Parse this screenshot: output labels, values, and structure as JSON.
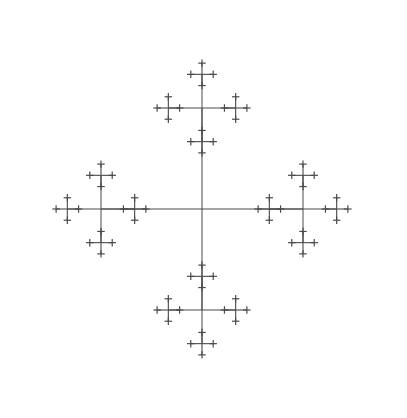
{
  "figure": {
    "background_color": "#ffffff",
    "stroke_color": "#4a4a4a",
    "caption": ""
  },
  "chart_data": {
    "type": "diagram",
    "subtitle": "",
    "xlabel": "",
    "ylabel": "",
    "grid": false,
    "legend": "none",
    "width": 407,
    "height": 418,
    "xlim": [
      0,
      407
    ],
    "ylim": [
      0,
      418
    ],
    "fractal": {
      "rule": "cross-with-children-at-arm-tips",
      "center_x": 202,
      "center_y": 209,
      "root_arm_length": 101,
      "scale_factor": 0.3333,
      "depth": 4,
      "branch_directions": [
        "up",
        "down",
        "left",
        "right"
      ],
      "stroke_color": "#4a4a4a",
      "stroke_widths": [
        1.0,
        1.0,
        1.1,
        1.2
      ],
      "overall_shape": "diamond",
      "extent": {
        "top_tip_y": 8,
        "bottom_tip_y": 410,
        "left_tip_x": 10,
        "right_tip_x": 394
      },
      "level_centers": {
        "level0": [
          [
            202,
            209
          ]
        ],
        "level1": [
          [
            202,
            108
          ],
          [
            202,
            310
          ],
          [
            101,
            209
          ],
          [
            303,
            209
          ]
        ],
        "level2_arm_length": 33.7,
        "level3_arm_length": 11.2,
        "level4_arm_length": 3.7
      }
    },
    "annotations": []
  }
}
